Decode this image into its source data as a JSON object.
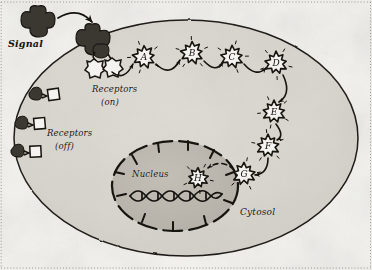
{
  "figure": {
    "kind": "hand-drawn-diagram",
    "background_color": "#f2f1ed",
    "ink_color": "#15120f",
    "cell_fill": "#d8d5ce",
    "nucleus_fill": "#bdb9b1",
    "signal_fill": "#3a3733",
    "border_style": "dotted"
  },
  "labels": {
    "signal": "Signal",
    "receptors_on_line1": "Receptors",
    "receptors_on_line2": "(on)",
    "receptors_off_line1": "Receptors",
    "receptors_off_line2": "(off)",
    "nucleus": "Nucleus",
    "cytosol": "Cytosol"
  },
  "cascade": {
    "note": "lettered starburst relay molecules",
    "steps": [
      {
        "id": "A",
        "label": "A",
        "cx": 144,
        "cy": 57,
        "r": 11,
        "location": "membrane-inner"
      },
      {
        "id": "B",
        "label": "B",
        "cx": 192,
        "cy": 53,
        "r": 11,
        "location": "membrane-inner"
      },
      {
        "id": "C",
        "label": "C",
        "cx": 232,
        "cy": 57,
        "r": 11,
        "location": "membrane-inner"
      },
      {
        "id": "D",
        "label": "D",
        "cx": 276,
        "cy": 63,
        "r": 11,
        "location": "membrane-inner"
      },
      {
        "id": "E",
        "label": "E",
        "cx": 274,
        "cy": 112,
        "r": 11,
        "location": "cytosol"
      },
      {
        "id": "F",
        "label": "F",
        "cx": 268,
        "cy": 146,
        "r": 11,
        "location": "cytosol"
      },
      {
        "id": "G",
        "label": "G",
        "cx": 244,
        "cy": 174,
        "r": 11,
        "location": "cytosol"
      },
      {
        "id": "H",
        "label": "H",
        "cx": 198,
        "cy": 178,
        "r": 10,
        "location": "nucleus"
      }
    ]
  },
  "receptors": {
    "active": [
      {
        "cx": 90,
        "cy": 72,
        "state": "on"
      },
      {
        "cx": 106,
        "cy": 70,
        "state": "on"
      }
    ],
    "inactive": [
      {
        "cx": 40,
        "cy": 95,
        "state": "off"
      },
      {
        "cx": 26,
        "cy": 124,
        "state": "off"
      },
      {
        "cx": 22,
        "cy": 152,
        "state": "off"
      }
    ]
  },
  "signal_molecules": [
    {
      "cx": 38,
      "cy": 22,
      "state": "free"
    },
    {
      "cx": 92,
      "cy": 40,
      "state": "bound"
    }
  ],
  "structures": {
    "cell_membrane": {
      "cx": 186,
      "cy": 138,
      "rx": 172,
      "ry": 118
    },
    "nucleus_membrane": {
      "cx": 175,
      "cy": 186,
      "rx": 63,
      "ry": 45
    },
    "dna_helix": {
      "x1": 130,
      "y1": 196,
      "x2": 222,
      "y2": 192
    },
    "nuclear_pore_count": 10
  },
  "arrows": {
    "signal_binding": "curved arrow from free signal to bound receptor",
    "cascade_links": "curved arrows A to B to C to D to E to F to G",
    "nuclear_import": "dashed arrow from G into nucleus to H"
  }
}
